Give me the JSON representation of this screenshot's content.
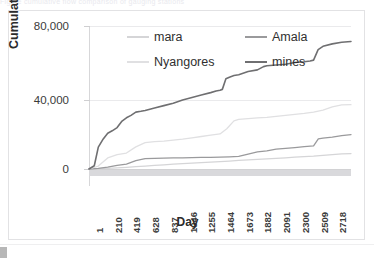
{
  "figure": {
    "top_clipped_text": "Figure cumulative flow comparison of gauging stations"
  },
  "chart_data": {
    "type": "line",
    "title": "",
    "xlabel": "Day",
    "ylabel": "Cumulative flow,m3/s",
    "xlim": [
      1,
      2927
    ],
    "ylim": [
      0,
      88000
    ],
    "yticks": [
      0,
      40000,
      80000
    ],
    "ytick_labels": [
      "0",
      "40,000",
      "80,000"
    ],
    "xticks": [
      1,
      210,
      419,
      628,
      837,
      1046,
      1255,
      1464,
      1673,
      1882,
      2091,
      2300,
      2509,
      2718
    ],
    "xtick_labels": [
      "1",
      "210",
      "419",
      "628",
      "837",
      "1046",
      "1255",
      "1464",
      "1673",
      "1882",
      "2091",
      "2300",
      "2509",
      "2718"
    ],
    "grid": "horizontal",
    "legend_position": "inside-top",
    "series": [
      {
        "name": "mara",
        "color": "#d5d5d7",
        "x": [
          1,
          105,
          210,
          315,
          419,
          524,
          628,
          733,
          837,
          942,
          1046,
          1151,
          1255,
          1360,
          1464,
          1569,
          1673,
          1778,
          1882,
          1987,
          2091,
          2196,
          2300,
          2405,
          2509,
          2614,
          2718,
          2823,
          2927
        ],
        "y": [
          0,
          150,
          400,
          700,
          1000,
          1400,
          1800,
          2200,
          2600,
          3000,
          3300,
          3600,
          3900,
          4200,
          4500,
          4900,
          5300,
          5600,
          5900,
          6200,
          6500,
          6900,
          7300,
          7600,
          7900,
          8400,
          8900,
          9300,
          9500
        ]
      },
      {
        "name": "Amala",
        "color": "#9a9a9c",
        "x": [
          1,
          105,
          210,
          315,
          419,
          524,
          628,
          733,
          837,
          942,
          1046,
          1151,
          1255,
          1360,
          1464,
          1569,
          1673,
          1778,
          1882,
          1987,
          2091,
          2196,
          2300,
          2405,
          2509,
          2562,
          2614,
          2718,
          2823,
          2927
        ],
        "y": [
          0,
          400,
          1200,
          2200,
          3000,
          5200,
          6400,
          6600,
          6700,
          6800,
          6900,
          7000,
          7100,
          7200,
          7300,
          7500,
          7800,
          9200,
          10500,
          11200,
          12200,
          12700,
          13200,
          13800,
          14200,
          18600,
          19000,
          19600,
          20600,
          21200
        ]
      },
      {
        "name": "Nyangores",
        "color": "#e0e0e2",
        "x": [
          1,
          105,
          210,
          315,
          419,
          524,
          628,
          733,
          837,
          942,
          1046,
          1151,
          1255,
          1360,
          1464,
          1540,
          1620,
          1673,
          1778,
          1882,
          1987,
          2091,
          2196,
          2300,
          2405,
          2509,
          2614,
          2718,
          2823,
          2927
        ],
        "y": [
          0,
          1800,
          6800,
          8800,
          9800,
          13600,
          16200,
          16800,
          17200,
          17800,
          18400,
          19200,
          20000,
          20800,
          21600,
          24800,
          29600,
          30600,
          31000,
          31400,
          31800,
          32400,
          33000,
          33600,
          34200,
          35000,
          36200,
          38200,
          39400,
          39600
        ]
      },
      {
        "name": "mines",
        "color": "#6f6f71",
        "x": [
          1,
          60,
          105,
          160,
          210,
          260,
          315,
          370,
          419,
          470,
          524,
          580,
          628,
          733,
          837,
          942,
          1046,
          1151,
          1255,
          1360,
          1420,
          1464,
          1490,
          1530,
          1569,
          1620,
          1673,
          1778,
          1882,
          1950,
          1987,
          2091,
          2196,
          2300,
          2405,
          2470,
          2509,
          2560,
          2614,
          2718,
          2823,
          2927
        ],
        "y": [
          0,
          2000,
          13500,
          18500,
          22000,
          23500,
          25500,
          29500,
          31500,
          33000,
          35000,
          35500,
          36000,
          37500,
          39000,
          40500,
          42500,
          44000,
          45500,
          47000,
          48000,
          48500,
          49000,
          55500,
          56500,
          57500,
          58000,
          60000,
          61000,
          63000,
          63500,
          64000,
          64500,
          65500,
          66000,
          66500,
          67000,
          73500,
          75500,
          77000,
          78000,
          78500
        ]
      }
    ]
  }
}
